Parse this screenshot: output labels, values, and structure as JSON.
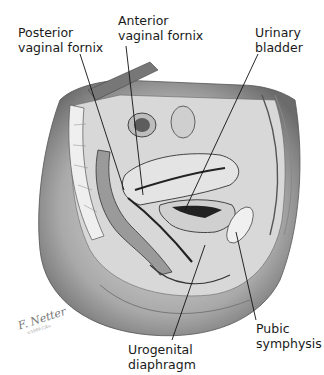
{
  "figure": {
    "labels": [
      {
        "id": "posterior-vaginal-fornix",
        "text": "Posterior\nvaginal fornix",
        "x": 18,
        "y": 26,
        "line": [
          80,
          54,
          124,
          190
        ]
      },
      {
        "id": "anterior-vaginal-fornix",
        "text": "Anterior\nvaginal fornix",
        "x": 118,
        "y": 14,
        "line": [
          126,
          46,
          143,
          195
        ]
      },
      {
        "id": "urinary-bladder",
        "text": "Urinary\nbladder",
        "x": 255,
        "y": 26,
        "line": [
          258,
          54,
          185,
          210
        ]
      },
      {
        "id": "urogenital-diaphragm",
        "text": "Urogenital\ndiaphragm",
        "x": 128,
        "y": 343,
        "line": [
          172,
          340,
          205,
          245
        ]
      },
      {
        "id": "pubic-symphysis",
        "text": "Pubic\nsymphysis",
        "x": 256,
        "y": 322,
        "line": [
          256,
          320,
          236,
          232
        ]
      }
    ],
    "signature": "F. Netter",
    "signature_sub": "©1989 Ciba"
  }
}
